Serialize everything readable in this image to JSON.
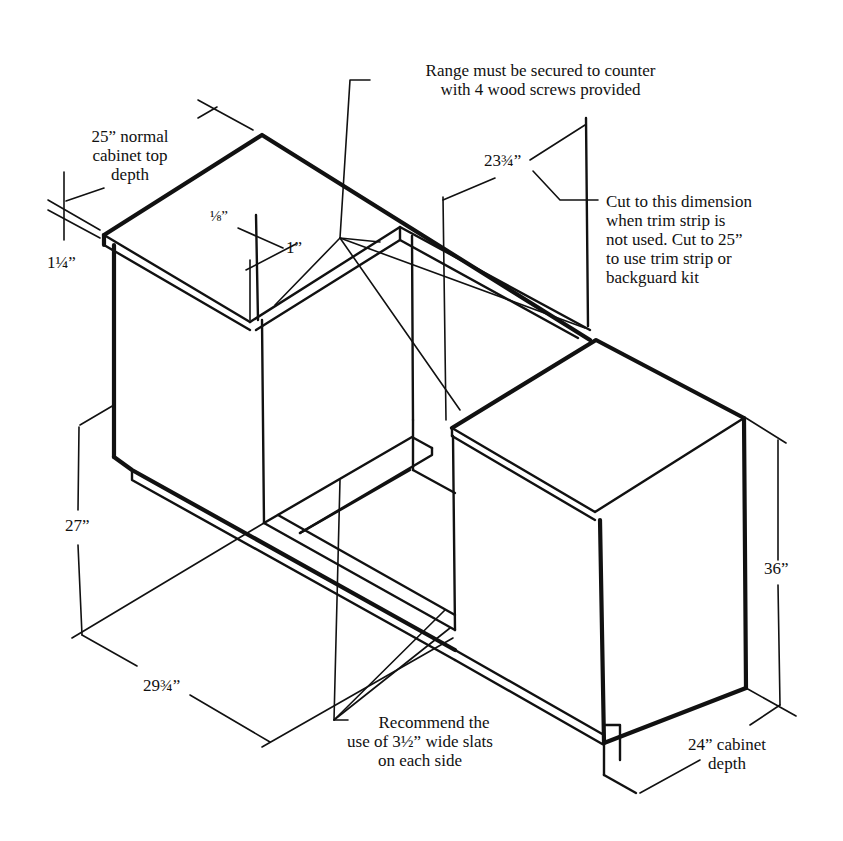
{
  "figure": {
    "colors": {
      "ink": "#111111",
      "background": "#ffffff"
    }
  },
  "labels": {
    "top_note": [
      "Range must be secured to counter",
      "with 4 wood screws provided"
    ],
    "top_depth": [
      "25” normal",
      "cabinet top",
      "depth"
    ],
    "top_thickness": "1¼”",
    "eighth": "⅛”",
    "one_inch": "1”",
    "cut_dim": "23¾”",
    "cut_note": [
      "Cut to this dimension",
      "when trim strip is",
      "not used. Cut to 25”",
      "to use trim strip or",
      "backguard kit"
    ],
    "height_27": "27”",
    "width_2975": "29¾”",
    "height_36": "36”",
    "slats_note": [
      "Recommend the",
      "use of 3½” wide slats",
      "on each side"
    ],
    "cabinet_depth": [
      "24” cabinet",
      "depth"
    ]
  }
}
